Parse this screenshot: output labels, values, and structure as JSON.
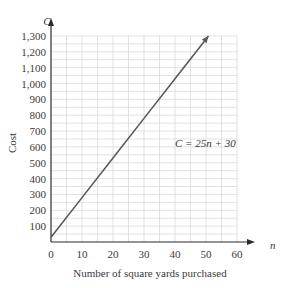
{
  "chart_data": {
    "type": "line",
    "title": "",
    "xlabel": "Number of square yards purchased",
    "ylabel": "Cost",
    "x_axis_var": "n",
    "y_axis_var": "C",
    "equation_label": "C = 25n + 30",
    "xlim": [
      0,
      60
    ],
    "ylim": [
      0,
      1300
    ],
    "x_ticks": [
      0,
      10,
      20,
      30,
      40,
      50,
      60
    ],
    "x_tick_labels": [
      "0",
      "10",
      "20",
      "30",
      "40",
      "50",
      "60"
    ],
    "y_ticks": [
      100,
      200,
      300,
      400,
      500,
      600,
      700,
      800,
      900,
      1000,
      1100,
      1200,
      1300
    ],
    "y_tick_labels": [
      "100",
      "200",
      "300",
      "400",
      "500",
      "600",
      "700",
      "800",
      "900",
      "1,000",
      "1,100",
      "1,200",
      "1,300"
    ],
    "grid": true,
    "grid_x_step": 5,
    "grid_y_step": 100,
    "series": [
      {
        "name": "C = 25n + 30",
        "x": [
          0,
          10,
          20,
          30,
          40,
          50.8
        ],
        "y": [
          30,
          280,
          530,
          780,
          1030,
          1300
        ]
      }
    ],
    "colors": {
      "line": "#5a5a5a",
      "grid": "#d9d9d9",
      "axis": "#2a2a2a",
      "text": "#3a3a3a"
    }
  }
}
